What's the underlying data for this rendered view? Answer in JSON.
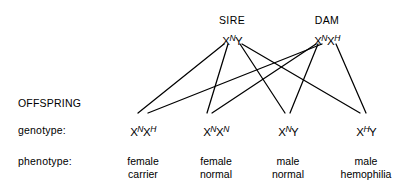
{
  "diagram": {
    "type": "genetic-cross-pedigree",
    "topic": "X-linked hemophilia inheritance",
    "background_color": "#ffffff",
    "line_color": "#000000"
  },
  "parents": [
    {
      "title": "SIRE",
      "title_x": 232,
      "title_y": 14,
      "genotype_x": 232,
      "genotype_y": 33,
      "allele_left": {
        "base": "X",
        "sup": "N"
      },
      "allele_right": {
        "base": "Y",
        "sup": ""
      },
      "allele_left_x": 224,
      "allele_right_x": 241
    },
    {
      "title": "DAM",
      "title_x": 327,
      "title_y": 14,
      "genotype_x": 327,
      "genotype_y": 33,
      "allele_left": {
        "base": "X",
        "sup": "N"
      },
      "allele_right": {
        "base": "X",
        "sup": "H"
      },
      "allele_left_x": 316,
      "allele_right_x": 337
    }
  ],
  "row_labels": [
    {
      "text": "OFFSPRING",
      "x": 18,
      "y": 97
    },
    {
      "text": "genotype:",
      "x": 18,
      "y": 124
    },
    {
      "text": "phenotype:",
      "x": 18,
      "y": 155
    }
  ],
  "offspring": [
    {
      "genotype_x": 143,
      "genotype_y": 124,
      "allele_left": {
        "base": "X",
        "sup": "N"
      },
      "allele_right": {
        "base": "X",
        "sup": "H"
      },
      "phenotype_line1": "female",
      "phenotype_line2": "carrier",
      "phenotype_x": 143,
      "phenotype_y": 155,
      "join_x": 143,
      "join_y": 116
    },
    {
      "genotype_x": 216,
      "genotype_y": 124,
      "allele_left": {
        "base": "X",
        "sup": "N"
      },
      "allele_right": {
        "base": "X",
        "sup": "N"
      },
      "phenotype_line1": "female",
      "phenotype_line2": "normal",
      "phenotype_x": 216,
      "phenotype_y": 155,
      "join_x": 209,
      "join_y": 116
    },
    {
      "genotype_x": 288,
      "genotype_y": 124,
      "allele_left": {
        "base": "X",
        "sup": "N"
      },
      "allele_right": {
        "base": "Y",
        "sup": ""
      },
      "phenotype_line1": "male",
      "phenotype_line2": "normal",
      "phenotype_x": 288,
      "phenotype_y": 155,
      "join_x": 284,
      "join_y": 116
    },
    {
      "genotype_x": 366,
      "genotype_y": 124,
      "allele_left": {
        "base": "X",
        "sup": "H"
      },
      "allele_right": {
        "base": "Y",
        "sup": ""
      },
      "phenotype_line1": "male",
      "phenotype_line2": "hemophilia",
      "phenotype_x": 366,
      "phenotype_y": 155,
      "join_x": 362,
      "join_y": 116
    }
  ],
  "connections": [
    {
      "from": "sire-XN",
      "to": "offspring-1",
      "x1": 224,
      "y1": 44,
      "x2": 138,
      "y2": 113
    },
    {
      "from": "sire-XN",
      "to": "offspring-2",
      "x1": 228,
      "y1": 44,
      "x2": 207,
      "y2": 113
    },
    {
      "from": "sire-Y",
      "to": "offspring-3",
      "x1": 240,
      "y1": 44,
      "x2": 285,
      "y2": 113
    },
    {
      "from": "sire-Y",
      "to": "offspring-4",
      "x1": 242,
      "y1": 44,
      "x2": 360,
      "y2": 113
    },
    {
      "from": "dam-XN",
      "to": "offspring-2",
      "x1": 316,
      "y1": 44,
      "x2": 212,
      "y2": 113
    },
    {
      "from": "dam-XN",
      "to": "offspring-3",
      "x1": 318,
      "y1": 44,
      "x2": 290,
      "y2": 113
    },
    {
      "from": "dam-XH",
      "to": "offspring-1",
      "x1": 322,
      "y1": 44,
      "x2": 148,
      "y2": 113
    },
    {
      "from": "dam-XH",
      "to": "offspring-4",
      "x1": 336,
      "y1": 44,
      "x2": 366,
      "y2": 113
    }
  ]
}
